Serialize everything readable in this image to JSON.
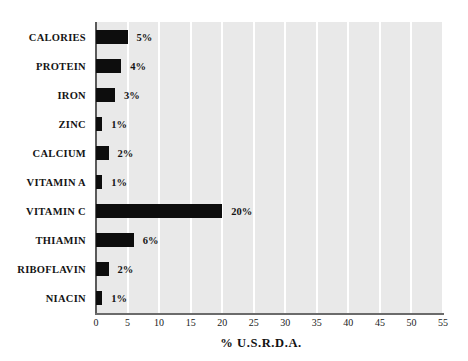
{
  "chart_data": {
    "type": "bar",
    "orientation": "horizontal",
    "title": "",
    "xlabel": "% U.S.R.D.A.",
    "ylabel": "",
    "categories": [
      "CALORIES",
      "PROTEIN",
      "IRON",
      "ZINC",
      "CALCIUM",
      "VITAMIN A",
      "VITAMIN C",
      "THIAMIN",
      "RIBOFLAVIN",
      "NIACIN"
    ],
    "values": [
      5,
      4,
      3,
      1,
      2,
      1,
      20,
      6,
      2,
      1
    ],
    "value_labels": [
      "5%",
      "4%",
      "3%",
      "1%",
      "2%",
      "1%",
      "20%",
      "6%",
      "2%",
      "1%"
    ],
    "xlim": [
      0,
      55
    ],
    "xticks": [
      0,
      5,
      10,
      15,
      20,
      25,
      30,
      35,
      40,
      45,
      50,
      55
    ],
    "xtick_labels": [
      "0",
      "5",
      "10",
      "15",
      "20",
      "25",
      "30",
      "35",
      "40",
      "45",
      "50",
      "55"
    ],
    "grid": "vertical",
    "legend": "none",
    "colors": {
      "bar": "#0d0d0d",
      "plot_background": "#e9e9e9",
      "gridline": "#ffffff",
      "axis": "#5a5a5a",
      "text": "#141414",
      "page_background": "#ffffff"
    }
  }
}
